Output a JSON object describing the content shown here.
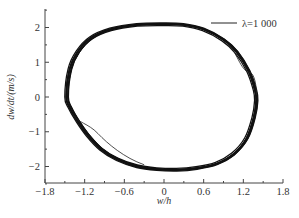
{
  "chart_data": {
    "type": "line",
    "title": "",
    "xlabel": "w/h",
    "ylabel": "dw/dt/(m/s)",
    "xlim": [
      -1.8,
      1.8
    ],
    "ylim": [
      -2.5,
      2.5
    ],
    "x_ticks": [
      -1.8,
      -1.2,
      -0.6,
      0,
      0.6,
      1.2,
      1.8
    ],
    "x_tick_labels": [
      "−1.8",
      "−1.2",
      "−0.6",
      "0",
      "0.6",
      "1.2",
      "1.8"
    ],
    "y_ticks": [
      -2,
      -1,
      0,
      1,
      2
    ],
    "y_tick_labels": [
      "−2",
      "−1",
      "0",
      "1",
      "2"
    ],
    "grid": false,
    "legend_position": "upper right",
    "series": [
      {
        "name": "λ=1 000",
        "color": "#111111",
        "description": "Phase-plane limit cycle (multiple overlapping orbits)",
        "x": [
          -1.47,
          -1.42,
          -1.3,
          -1.1,
          -0.8,
          -0.4,
          0.0,
          0.3,
          0.6,
          0.9,
          1.1,
          1.28,
          1.38,
          1.4,
          1.36,
          1.25,
          1.05,
          0.8,
          0.5,
          0.2,
          -0.1,
          -0.4,
          -0.7,
          -0.95,
          -1.15,
          -1.3,
          -1.42,
          -1.47
        ],
        "y": [
          0.0,
          0.8,
          1.3,
          1.7,
          1.95,
          2.08,
          2.1,
          2.08,
          1.95,
          1.65,
          1.3,
          0.75,
          0.2,
          -0.1,
          -0.6,
          -1.2,
          -1.65,
          -1.92,
          -2.05,
          -2.1,
          -2.08,
          -2.0,
          -1.8,
          -1.5,
          -1.1,
          -0.7,
          -0.3,
          0.0
        ]
      }
    ]
  },
  "legend": {
    "label": "λ=1 000"
  },
  "axes": {
    "xlabel": "w/h",
    "ylabel": "dw/dt/(m/s)"
  }
}
